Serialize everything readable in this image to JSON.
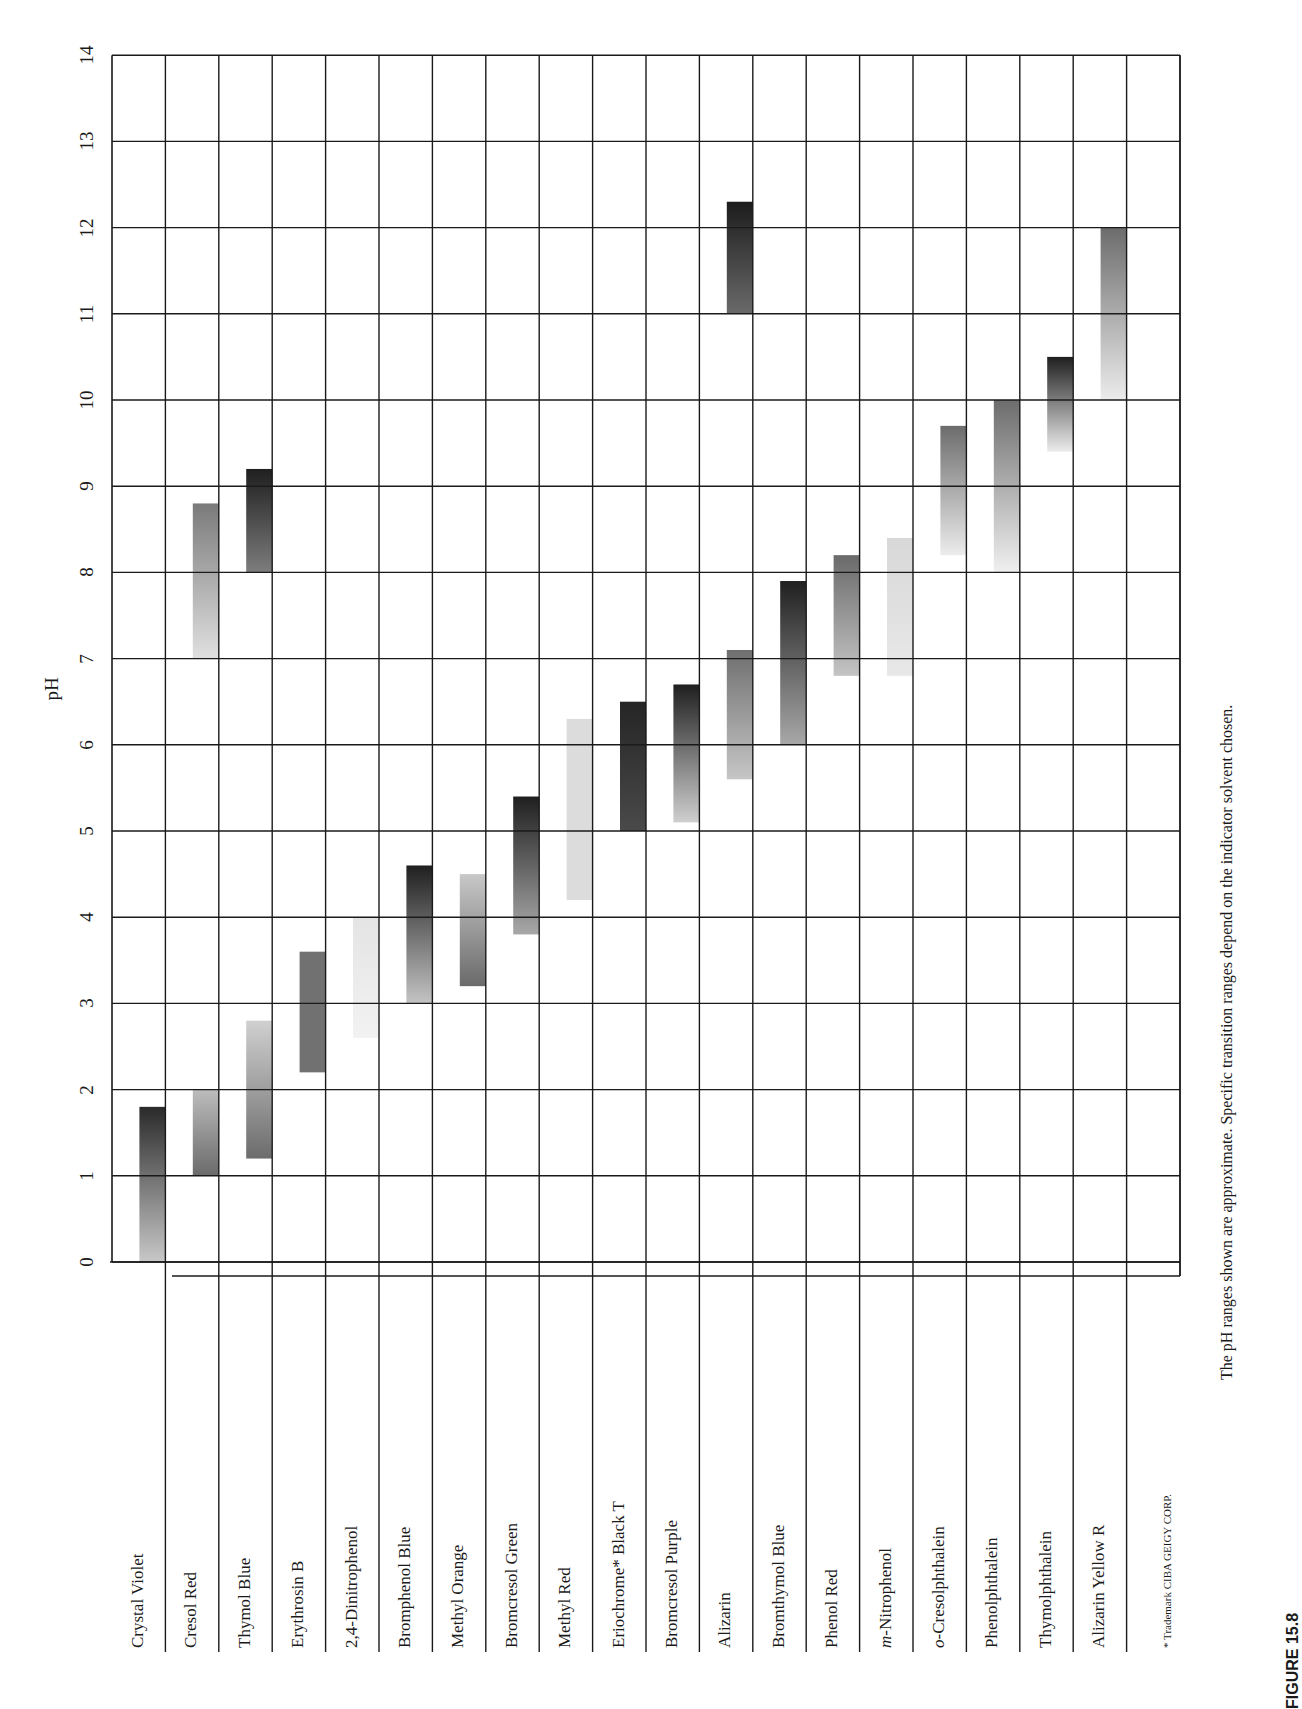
{
  "chart_data": {
    "type": "bar",
    "subtype": "range-bar (floating bars), page rotated 90° counter-clockwise",
    "title": "",
    "ylabel": "pH",
    "xlabel": "",
    "ylim": [
      0,
      14
    ],
    "yticks": [
      0,
      1,
      2,
      3,
      4,
      5,
      6,
      7,
      8,
      9,
      10,
      11,
      12,
      13,
      14
    ],
    "grid": true,
    "categories": [
      "Crystal Violet",
      "Cresol Red",
      "Thymol Blue",
      "Erythrosin B",
      "2,4-Dinitrophenol",
      "Bromphenol Blue",
      "Methyl Orange",
      "Bromcresol Green",
      "Methyl Red",
      "Eriochrome* Black T",
      "Bromcresol Purple",
      "Alizarin",
      "Bromthymol Blue",
      "Phenol Red",
      "m-Nitrophenol",
      "o-Cresolphthalein",
      "Phenolphthalein",
      "Thymolphthalein",
      "Alizarin Yellow R"
    ],
    "ranges": [
      {
        "indicator": "Crystal Violet",
        "ranges": [
          [
            0.0,
            1.8
          ]
        ],
        "shade": [
          [
            "#2a2a2a",
            "#c8c8c8"
          ]
        ]
      },
      {
        "indicator": "Cresol Red",
        "ranges": [
          [
            1.0,
            2.0
          ],
          [
            7.0,
            8.8
          ]
        ],
        "shade": [
          [
            "#bdbdbd",
            "#6a6a6a"
          ],
          [
            "#7a7a7a",
            "#e0e0e0"
          ]
        ]
      },
      {
        "indicator": "Thymol Blue",
        "ranges": [
          [
            1.2,
            2.8
          ],
          [
            8.0,
            9.2
          ]
        ],
        "shade": [
          [
            "#d0d0d0",
            "#6c6c6c"
          ],
          [
            "#1f1f1f",
            "#7d7d7d"
          ]
        ]
      },
      {
        "indicator": "Erythrosin B",
        "ranges": [
          [
            2.2,
            3.6
          ]
        ],
        "shade": [
          [
            "#717171",
            "#717171"
          ]
        ]
      },
      {
        "indicator": "2,4-Dinitrophenol",
        "ranges": [
          [
            2.6,
            4.0
          ]
        ],
        "shade": [
          [
            "#e4e4e4",
            "#f2f2f2"
          ]
        ]
      },
      {
        "indicator": "Bromphenol Blue",
        "ranges": [
          [
            3.0,
            4.6
          ]
        ],
        "shade": [
          [
            "#1f1f1f",
            "#c4c4c4"
          ]
        ]
      },
      {
        "indicator": "Methyl Orange",
        "ranges": [
          [
            3.2,
            4.5
          ]
        ],
        "shade": [
          [
            "#c8c8c8",
            "#6a6a6a"
          ]
        ]
      },
      {
        "indicator": "Bromcresol Green",
        "ranges": [
          [
            3.8,
            5.4
          ]
        ],
        "shade": [
          [
            "#1f1f1f",
            "#a8a8a8"
          ]
        ]
      },
      {
        "indicator": "Methyl Red",
        "ranges": [
          [
            4.2,
            6.3
          ]
        ],
        "shade": [
          [
            "#dcdcdc",
            "#dcdcdc"
          ]
        ]
      },
      {
        "indicator": "Eriochrome* Black T",
        "ranges": [
          [
            5.0,
            6.5
          ]
        ],
        "shade": [
          [
            "#252525",
            "#4a4a4a"
          ]
        ]
      },
      {
        "indicator": "Bromcresol Purple",
        "ranges": [
          [
            5.1,
            6.7
          ]
        ],
        "shade": [
          [
            "#1f1f1f",
            "#cfcfcf"
          ]
        ]
      },
      {
        "indicator": "Alizarin",
        "ranges": [
          [
            5.6,
            7.1
          ],
          [
            11.0,
            12.3
          ]
        ],
        "shade": [
          [
            "#6f6f6f",
            "#c6c6c6"
          ],
          [
            "#1c1c1c",
            "#6a6a6a"
          ]
        ]
      },
      {
        "indicator": "Bromthymol Blue",
        "ranges": [
          [
            6.0,
            7.9
          ]
        ],
        "shade": [
          [
            "#202020",
            "#a8a8a8"
          ]
        ]
      },
      {
        "indicator": "Phenol Red",
        "ranges": [
          [
            6.8,
            8.2
          ]
        ],
        "shade": [
          [
            "#6a6a6a",
            "#c4c4c4"
          ]
        ]
      },
      {
        "indicator": "m-Nitrophenol",
        "ranges": [
          [
            6.8,
            8.4
          ]
        ],
        "shade": [
          [
            "#d8d8d8",
            "#e8e8e8"
          ]
        ]
      },
      {
        "indicator": "o-Cresolphthalein",
        "ranges": [
          [
            8.2,
            9.7
          ]
        ],
        "shade": [
          [
            "#6c6c6c",
            "#ececec"
          ]
        ]
      },
      {
        "indicator": "Phenolphthalein",
        "ranges": [
          [
            8.0,
            10.0
          ]
        ],
        "shade": [
          [
            "#6c6c6c",
            "#f0f0f0"
          ]
        ]
      },
      {
        "indicator": "Thymolphthalein",
        "ranges": [
          [
            9.4,
            10.5
          ]
        ],
        "shade": [
          [
            "#1f1f1f",
            "#ececec"
          ]
        ]
      },
      {
        "indicator": "Alizarin Yellow R",
        "ranges": [
          [
            10.0,
            12.0
          ]
        ],
        "shade": [
          [
            "#6c6c6c",
            "#ececec"
          ]
        ]
      }
    ],
    "annotations": [
      "* Trademark CIBA GEIGY CORP.",
      "The pH ranges shown are approximate.  Specific transition ranges depend on the indicator solvent chosen."
    ]
  },
  "labels": {
    "ylabel": "pH",
    "footnote": "* Trademark CIBA GEIGY CORP.",
    "note": "The pH ranges shown are approximate.  Specific transition ranges depend on the indicator solvent chosen.",
    "figure": "FIGURE 15.8"
  }
}
